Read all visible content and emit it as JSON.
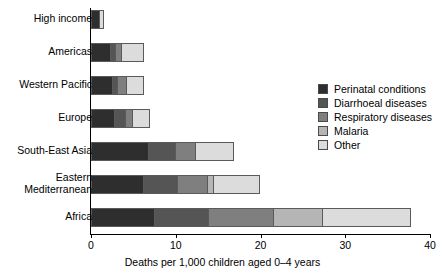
{
  "chart_data": {
    "type": "bar",
    "orientation": "horizontal",
    "stacked": true,
    "title": "",
    "xlabel": "Deaths per 1,000 children aged 0–4 years",
    "ylabel": "",
    "xlim": [
      0,
      40
    ],
    "xticks": [
      0,
      10,
      20,
      30,
      40
    ],
    "xtick_labels": [
      "0",
      "10",
      "20",
      "30",
      "40"
    ],
    "grid": false,
    "legend_position": "right",
    "categories": [
      "High income",
      "Americas",
      "Western Pacific",
      "Europe",
      "South-East Asia",
      "Eastern\nMediterranean",
      "Africa"
    ],
    "series": [
      {
        "name": "Perinatal conditions",
        "color": "#2e2e2e",
        "values": [
          1.1,
          2.4,
          2.6,
          2.8,
          6.8,
          6.3,
          7.6
        ]
      },
      {
        "name": "Diarrhoeal diseases",
        "color": "#555555",
        "values": [
          0.0,
          0.5,
          0.6,
          1.3,
          3.2,
          4.0,
          6.3
        ]
      },
      {
        "name": "Respiratory diseases",
        "color": "#7f7f7f",
        "values": [
          0.0,
          0.8,
          1.1,
          0.8,
          2.4,
          3.5,
          7.7
        ]
      },
      {
        "name": "Malaria",
        "color": "#b5b5b5",
        "values": [
          0.0,
          0.0,
          0.0,
          0.0,
          0.0,
          0.7,
          5.8
        ]
      },
      {
        "name": "Other",
        "color": "#dcdcdc",
        "values": [
          0.4,
          2.6,
          2.0,
          2.1,
          4.5,
          5.5,
          10.4
        ]
      }
    ],
    "totals": [
      1.5,
      6.3,
      6.3,
      7.0,
      16.9,
      20.0,
      37.8
    ]
  },
  "legend": {
    "items": [
      {
        "label": "Perinatal conditions",
        "color": "#2e2e2e"
      },
      {
        "label": "Diarrhoeal diseases",
        "color": "#555555"
      },
      {
        "label": "Respiratory diseases",
        "color": "#7f7f7f"
      },
      {
        "label": "Malaria",
        "color": "#b5b5b5"
      },
      {
        "label": "Other",
        "color": "#dcdcdc"
      }
    ]
  },
  "axis": {
    "x_title": "Deaths per 1,000 children aged 0–4 years",
    "tick_labels": [
      "0",
      "10",
      "20",
      "30",
      "40"
    ]
  }
}
